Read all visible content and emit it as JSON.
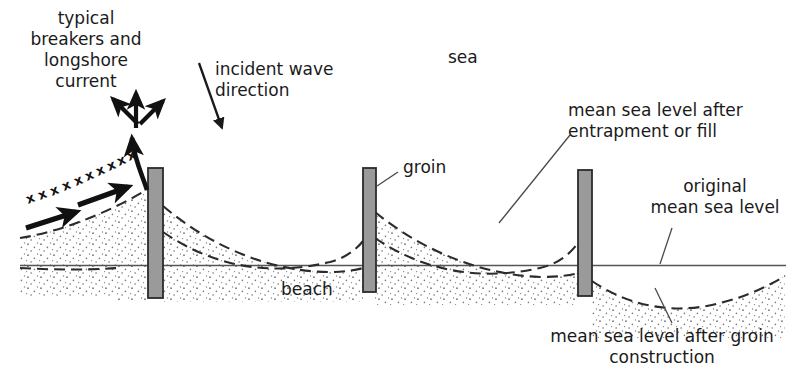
{
  "diagram": {
    "colors": {
      "ink": "#1a1a1a",
      "groin_fill": "#9a9a9a",
      "groin_stroke": "#2b2b2b",
      "sea_level_line": "#555555",
      "dashed_profile": "#2b2b2b",
      "sand_stipple": "#6e6e6e",
      "leader_line": "#4a4a4a",
      "background": "#ffffff"
    },
    "labels": {
      "typical_breakers": "typical\nbreakers and\nlongshore\ncurrent",
      "incident_wave": "incident wave\ndirection",
      "sea": "sea",
      "groin": "groin",
      "beach": "beach",
      "msl_entrapment": "mean sea level after\nentrapment or fill",
      "msl_original": "original\nmean sea level",
      "msl_after_construction": "mean sea level after groin\nconstruction"
    },
    "icons": {
      "incident_wave_arrow": "arrow-down-right-icon",
      "longshore_arrow_left": "arrow-up-left-icon",
      "longshore_arrow_up": "arrow-up-icon",
      "longshore_arrow_right": "arrow-up-right-icon",
      "curved_refraction_arrow": "curved-arrow-up-icon",
      "drift_arrow_lower": "arrow-right-up-icon",
      "drift_arrow_upper": "arrow-right-up-icon",
      "breaker_crest_marks": "x-crest-marks-icon"
    },
    "elements": {
      "groin_count": 3,
      "groin_names": [
        "groin-left",
        "groin-middle",
        "groin-right"
      ],
      "original_sea_level_label": "original mean sea level",
      "breaker_mark_glyph": "x"
    }
  }
}
